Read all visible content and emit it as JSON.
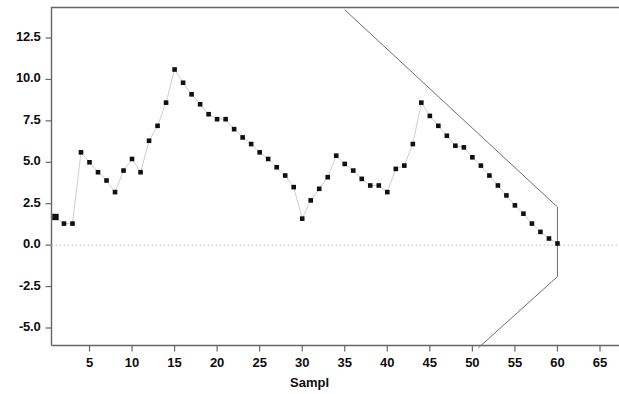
{
  "chart_data": {
    "type": "scatter",
    "title": "",
    "subtitle": "",
    "xlabel": "Sampl",
    "ylabel": "",
    "xlim": [
      0.5,
      66.5
    ],
    "ylim": [
      -6.2,
      14.2
    ],
    "grid": false,
    "legend": null,
    "marker": "filled-square",
    "marker_color": "#101010",
    "line_color": "#cfcfcf",
    "frame_color": "#666666",
    "zero_line": {
      "value": 0.0,
      "style": "dotted",
      "color": "#b9b9b9"
    },
    "x_ticks": [
      5,
      10,
      15,
      20,
      25,
      30,
      35,
      40,
      45,
      50,
      55,
      60,
      65
    ],
    "x_tick_labels": [
      "5",
      "10",
      "15",
      "20",
      "25",
      "30",
      "35",
      "40",
      "45",
      "50",
      "55",
      "60",
      "65"
    ],
    "y_ticks": [
      12.5,
      10.0,
      7.5,
      5.0,
      2.5,
      0.0,
      -2.5,
      -5.0
    ],
    "y_tick_labels": [
      "12.5",
      "10.0",
      "7.5",
      "5.0",
      "2.5",
      "0.0",
      "-2.5",
      "-5.0"
    ],
    "x": [
      1,
      2,
      3,
      4,
      5,
      6,
      7,
      8,
      9,
      10,
      11,
      12,
      13,
      14,
      15,
      16,
      17,
      18,
      19,
      20,
      21,
      22,
      23,
      24,
      25,
      26,
      27,
      28,
      29,
      30,
      31,
      32,
      33,
      34,
      35,
      36,
      37,
      38,
      39,
      40,
      41,
      42,
      43,
      44,
      45,
      46,
      47,
      48,
      49,
      50,
      51,
      52,
      53,
      54,
      55,
      56,
      57,
      58,
      59,
      60
    ],
    "y": [
      1.7,
      1.3,
      1.3,
      5.6,
      5.0,
      4.4,
      3.9,
      3.2,
      4.5,
      5.2,
      4.4,
      6.3,
      7.2,
      8.6,
      10.6,
      9.8,
      9.1,
      8.5,
      7.9,
      7.6,
      7.6,
      7.0,
      6.5,
      6.1,
      5.6,
      5.2,
      4.7,
      4.2,
      3.5,
      1.6,
      2.7,
      3.4,
      4.1,
      5.4,
      4.9,
      4.5,
      4.0,
      3.6,
      3.6,
      3.2,
      4.6,
      4.8,
      6.1,
      8.6,
      7.8,
      7.2,
      6.6,
      6.0,
      5.9,
      5.3,
      4.8,
      4.2,
      3.6,
      3.0,
      2.4,
      1.9,
      1.3,
      0.8,
      0.4,
      0.1
    ],
    "series": [
      {
        "name": "observed",
        "values": [
          1.7,
          1.3,
          1.3,
          5.6,
          5.0,
          4.4,
          3.9,
          3.2,
          4.5,
          5.2,
          4.4,
          6.3,
          7.2,
          8.6,
          10.6,
          9.8,
          9.1,
          8.5,
          7.9,
          7.6,
          7.6,
          7.0,
          6.5,
          6.1,
          5.6,
          5.2,
          4.7,
          4.2,
          3.5,
          1.6,
          2.7,
          3.4,
          4.1,
          5.4,
          4.9,
          4.5,
          4.0,
          3.6,
          3.6,
          3.2,
          4.6,
          4.8,
          6.1,
          8.6,
          7.8,
          7.2,
          6.6,
          6.0,
          5.9,
          5.3,
          4.8,
          4.2,
          3.6,
          3.0,
          2.4,
          1.9,
          1.3,
          0.8,
          0.4,
          0.1
        ]
      }
    ],
    "envelope": {
      "name": "convergence-bounds",
      "upper": [
        [
          35.0,
          14.2
        ],
        [
          60.0,
          2.3
        ],
        [
          60.0,
          0.1
        ]
      ],
      "lower": [
        [
          50.7,
          -6.2
        ],
        [
          60.0,
          -1.9
        ],
        [
          60.0,
          0.1
        ]
      ],
      "color": "#6e6e6e"
    },
    "peak_point": {
      "x": 15,
      "y": 10.6
    },
    "final_point": {
      "x": 60,
      "y": 0.1
    },
    "n_points": 60
  }
}
